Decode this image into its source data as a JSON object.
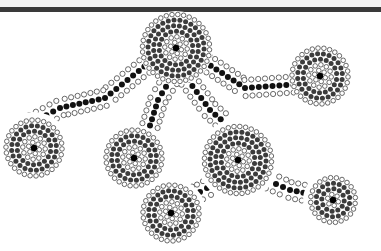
{
  "artwork": {
    "title": "Dot painting: connected concentric circles",
    "colors": {
      "background": "#ffffff",
      "header_bar": "#3a3a3a",
      "ring_outline": "#444444",
      "fill_dark": "#111111",
      "fill_mid": "#3c3c3c",
      "center": "#000000"
    },
    "nodes": [
      {
        "name": "top-center-circle"
      },
      {
        "name": "left-circle"
      },
      {
        "name": "right-upper-circle"
      },
      {
        "name": "middle-left-circle"
      },
      {
        "name": "center-right-circle"
      },
      {
        "name": "bottom-center-circle"
      },
      {
        "name": "right-lower-circle"
      }
    ],
    "paths": [
      {
        "name": "path-top-to-left"
      },
      {
        "name": "path-top-to-right-upper"
      },
      {
        "name": "path-top-to-middle-left"
      },
      {
        "name": "path-top-to-center-right"
      },
      {
        "name": "path-center-right-to-right-lower"
      },
      {
        "name": "path-center-right-to-bottom"
      }
    ]
  }
}
